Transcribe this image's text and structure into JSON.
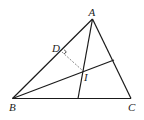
{
  "diagram": {
    "type": "geometry-triangle",
    "points": {
      "A": {
        "label": "A",
        "x": 92.5,
        "y": 19
      },
      "B": {
        "label": "B",
        "x": 12.5,
        "y": 98.5
      },
      "C": {
        "label": "C",
        "x": 131,
        "y": 98.5
      },
      "D": {
        "label": "D",
        "x": 62,
        "y": 52
      },
      "I": {
        "label": "I",
        "x": 82.5,
        "y": 70.5
      }
    },
    "segments": [
      {
        "from": "A",
        "to": "B",
        "style": "solid"
      },
      {
        "from": "B",
        "to": "C",
        "style": "solid"
      },
      {
        "from": "C",
        "to": "A",
        "style": "solid"
      },
      {
        "from": "A",
        "to": "BC-foot",
        "style": "solid"
      },
      {
        "from": "B",
        "to": "AC-point",
        "style": "solid"
      },
      {
        "from": "D",
        "to": "I",
        "style": "dashed"
      }
    ],
    "right_angle_at": "D",
    "colors": {
      "line": "#1a1a1a",
      "dashed": "#888888",
      "background": "#ffffff"
    }
  }
}
